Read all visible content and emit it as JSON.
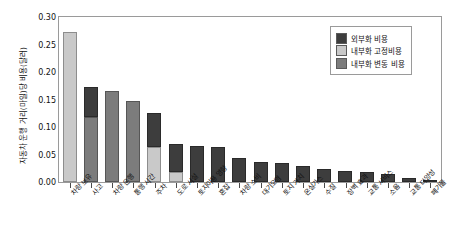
{
  "chart_data": {
    "type": "bar",
    "title": "",
    "subtitle": "",
    "xlabel": "",
    "ylabel": "자동차 운행 거리(마일)당 비용(달러)",
    "ylim": [
      0.0,
      0.3
    ],
    "ytick_labels": [
      "0.30",
      "0.25",
      "0.20",
      "0.15",
      "0.10",
      "0.05",
      "0.00"
    ],
    "ytick_values": [
      0.3,
      0.25,
      0.2,
      0.15,
      0.1,
      0.05,
      0.0
    ],
    "grid": false,
    "stacked": true,
    "legend_position": "top-right",
    "categories": [
      "차량 보유",
      "사고",
      "차량 운행",
      "통행 시간",
      "주차",
      "도로 시설",
      "토지이용 영향",
      "혼잡",
      "차량 소비",
      "대기오염",
      "토지 가치",
      "온실가스",
      "수질",
      "장벽 효과",
      "교통 서비스",
      "소음",
      "교통 다양성",
      "폐기물"
    ],
    "series": [
      {
        "name": "내부화 고정비용",
        "color": "#c9c9c9",
        "values": [
          0.272,
          0.0,
          0.0,
          0.0,
          0.063,
          0.019,
          0.0,
          0.0,
          0.0,
          0.0,
          0.0,
          0.0,
          0.0,
          0.0,
          0.0,
          0.0,
          0.0,
          0.0
        ]
      },
      {
        "name": "내부화 변동 비용",
        "color": "#7c7c7c",
        "values": [
          0.0,
          0.118,
          0.165,
          0.148,
          0.0,
          0.0,
          0.0,
          0.0,
          0.0,
          0.0,
          0.0,
          0.0,
          0.0,
          0.0,
          0.0,
          0.0,
          0.0,
          0.0
        ]
      },
      {
        "name": "외부화 비용",
        "color": "#3d3d3d",
        "values": [
          0.0,
          0.055,
          0.0,
          0.0,
          0.062,
          0.05,
          0.066,
          0.063,
          0.044,
          0.036,
          0.034,
          0.03,
          0.023,
          0.02,
          0.019,
          0.015,
          0.007,
          0.002
        ]
      }
    ]
  },
  "legend": {
    "entries": [
      {
        "label": "외부화 비용",
        "color": "#3d3d3d",
        "key": "ext"
      },
      {
        "label": "내부화 고정비용",
        "color": "#c9c9c9",
        "key": "fix"
      },
      {
        "label": "내부화 변동 비용",
        "color": "#7c7c7c",
        "key": "var"
      }
    ]
  }
}
